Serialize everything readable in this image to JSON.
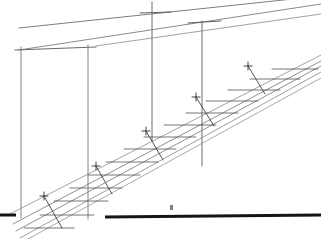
{
  "document": {
    "kind": "hand-drawn perspective construction sketch",
    "title": "Perspective construction sketch of an inclined ramp / stair soffit",
    "medium": "graphite pencil on white paper",
    "background_color": "#ffffff",
    "canvas": {
      "width": 321,
      "height": 239
    },
    "visible_text": [],
    "annotations": []
  },
  "ink": {
    "light_gray": "#9a9a9a",
    "mid_gray": "#6f6f6f",
    "dark_gray": "#4a4a4a",
    "pencil_black": "#2b2b2b",
    "heavy_black": "#151515"
  },
  "geometry": {
    "upper_convergence_lines": [
      {
        "name": "upper-edge-line-1",
        "x1": 19,
        "y1": 28,
        "x2": 321,
        "y2": -4,
        "weight": 0.9,
        "color": "#6f6f6f"
      },
      {
        "name": "upper-edge-line-2",
        "x1": 19,
        "y1": 50,
        "x2": 321,
        "y2": 4,
        "weight": 0.9,
        "color": "#7d7d7d"
      },
      {
        "name": "upper-edge-line-3",
        "x1": 96,
        "y1": 46,
        "x2": 321,
        "y2": 14,
        "weight": 0.8,
        "color": "#8a8a8a"
      }
    ],
    "horizontal_ties": [
      {
        "name": "tie-top-left",
        "x1": 15,
        "y1": 50,
        "x2": 96,
        "y2": 47,
        "weight": 1.0,
        "color": "#6a6a6a"
      },
      {
        "name": "tie-mast-3-cap",
        "x1": 140,
        "y1": 13,
        "x2": 171,
        "y2": 12,
        "weight": 1.0,
        "color": "#5c5c5c"
      },
      {
        "name": "tie-mast-4-cap",
        "x1": 188,
        "y1": 23,
        "x2": 221,
        "y2": 21,
        "weight": 1.0,
        "color": "#5c5c5c"
      }
    ],
    "vertical_masts": [
      {
        "name": "mast-1",
        "x": 21,
        "y_top": 47,
        "y_bottom": 218,
        "weight": 1.0,
        "color": "#828282"
      },
      {
        "name": "mast-2",
        "x": 88,
        "y_top": 45,
        "y_bottom": 219,
        "weight": 1.0,
        "color": "#828282"
      },
      {
        "name": "mast-3",
        "x": 152,
        "y_top": 2,
        "y_bottom": 141,
        "weight": 1.0,
        "color": "#6e6e6e"
      },
      {
        "name": "mast-4",
        "x": 202,
        "y_top": 21,
        "y_bottom": 166,
        "weight": 1.0,
        "color": "#6e6e6e"
      }
    ],
    "ramp_rails": [
      {
        "name": "ramp-rail-1",
        "x1": 13,
        "y1": 224,
        "x2": 321,
        "y2": 61,
        "weight": 0.85,
        "color": "#7b7b7b"
      },
      {
        "name": "ramp-rail-2",
        "x1": 16,
        "y1": 231,
        "x2": 321,
        "y2": 66,
        "weight": 0.85,
        "color": "#7b7b7b"
      },
      {
        "name": "ramp-rail-3",
        "x1": 20,
        "y1": 238,
        "x2": 321,
        "y2": 72,
        "weight": 0.85,
        "color": "#8a8a8a"
      },
      {
        "name": "ramp-rail-4",
        "x1": 28,
        "y1": 239,
        "x2": 321,
        "y2": 78,
        "weight": 0.8,
        "color": "#929292"
      },
      {
        "name": "ramp-rail-5",
        "x1": 6,
        "y1": 216,
        "x2": 321,
        "y2": 55,
        "weight": 0.8,
        "color": "#8d8d8d"
      }
    ],
    "ramp_rungs": [
      {
        "name": "rung-1",
        "x1": 24,
        "y1": 228,
        "x2": 74,
        "y2": 228
      },
      {
        "name": "rung-2",
        "x1": 40,
        "y1": 215,
        "x2": 94,
        "y2": 215
      },
      {
        "name": "rung-3",
        "x1": 54,
        "y1": 201,
        "x2": 108,
        "y2": 201
      },
      {
        "name": "rung-4",
        "x1": 70,
        "y1": 188,
        "x2": 122,
        "y2": 188
      },
      {
        "name": "rung-5",
        "x1": 88,
        "y1": 175,
        "x2": 140,
        "y2": 175
      },
      {
        "name": "rung-6",
        "x1": 106,
        "y1": 162,
        "x2": 158,
        "y2": 162
      },
      {
        "name": "rung-7",
        "x1": 124,
        "y1": 149,
        "x2": 176,
        "y2": 149
      },
      {
        "name": "rung-8",
        "x1": 144,
        "y1": 137,
        "x2": 196,
        "y2": 137
      },
      {
        "name": "rung-9",
        "x1": 164,
        "y1": 125,
        "x2": 216,
        "y2": 125
      },
      {
        "name": "rung-10",
        "x1": 186,
        "y1": 113,
        "x2": 238,
        "y2": 113
      },
      {
        "name": "rung-11",
        "x1": 206,
        "y1": 101,
        "x2": 258,
        "y2": 101
      },
      {
        "name": "rung-12",
        "x1": 228,
        "y1": 90,
        "x2": 280,
        "y2": 90
      },
      {
        "name": "rung-13",
        "x1": 250,
        "y1": 79,
        "x2": 300,
        "y2": 79
      },
      {
        "name": "rung-14",
        "x1": 272,
        "y1": 69,
        "x2": 318,
        "y2": 69
      }
    ],
    "cross_braces": [
      {
        "name": "cross-brace-1",
        "x1": 62,
        "y1": 228,
        "x2": 44,
        "y2": 196
      },
      {
        "name": "cross-brace-2",
        "x1": 112,
        "y1": 194,
        "x2": 96,
        "y2": 166
      },
      {
        "name": "cross-brace-3",
        "x1": 163,
        "y1": 160,
        "x2": 146,
        "y2": 131
      },
      {
        "name": "cross-brace-4",
        "x1": 214,
        "y1": 126,
        "x2": 196,
        "y2": 97
      },
      {
        "name": "cross-brace-5",
        "x1": 265,
        "y1": 94,
        "x2": 248,
        "y2": 66
      }
    ],
    "rung_ticks": [
      {
        "name": "tick-node-a",
        "x": 44,
        "y": 196
      },
      {
        "name": "tick-node-b",
        "x": 96,
        "y": 166
      },
      {
        "name": "tick-node-c",
        "x": 146,
        "y": 131
      },
      {
        "name": "tick-node-d",
        "x": 196,
        "y": 97
      },
      {
        "name": "tick-node-e",
        "x": 248,
        "y": 66
      }
    ],
    "ground_lines": [
      {
        "name": "ground-line-left",
        "x1": 0,
        "y1": 215,
        "x2": 16,
        "y2": 215,
        "weight": 3.0,
        "color": "#151515"
      },
      {
        "name": "ground-line-right",
        "x1": 105,
        "y1": 217,
        "x2": 321,
        "y2": 215,
        "weight": 3.0,
        "color": "#151515"
      }
    ],
    "stray_marks": [
      {
        "name": "stray-pencil-mark",
        "x": 170,
        "y": 205,
        "w": 3,
        "h": 5
      }
    ]
  }
}
